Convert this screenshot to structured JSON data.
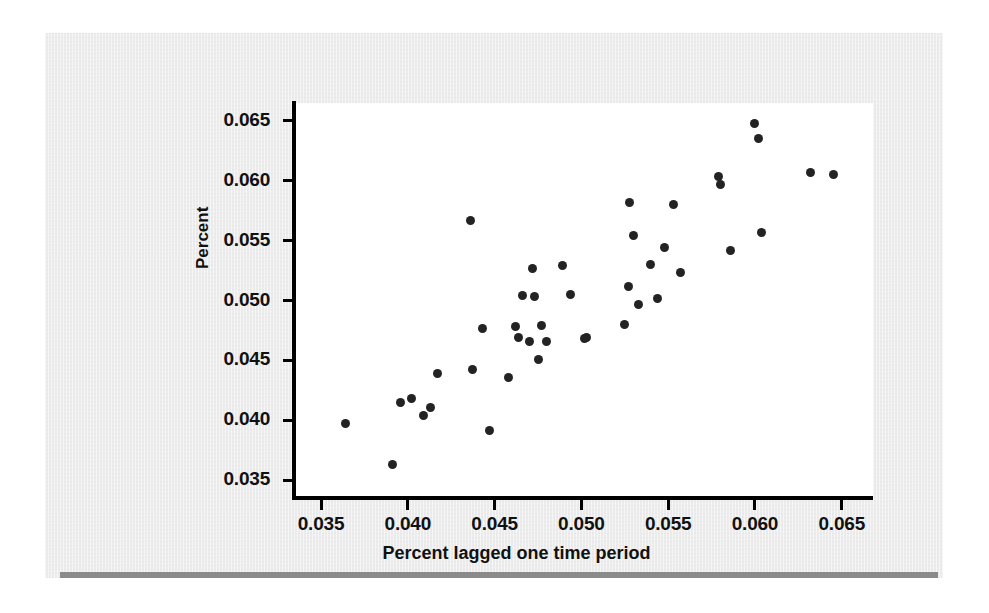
{
  "figure": {
    "background_color": "#ececec",
    "page_background": "#ffffff",
    "rule_color": "#8b8b8b",
    "plot_background": "#ffffff",
    "axis_color": "#000000",
    "point_color": "#232323"
  },
  "chart_data": {
    "type": "scatter",
    "title": "",
    "subtitle": "",
    "xlabel": "Percent lagged one time period",
    "ylabel": "Percent",
    "xlim": [
      0.0335,
      0.0668
    ],
    "ylim": [
      0.0335,
      0.0665
    ],
    "xticks": [
      0.035,
      0.04,
      0.045,
      0.05,
      0.055,
      0.06,
      0.065
    ],
    "yticks": [
      0.035,
      0.04,
      0.045,
      0.05,
      0.055,
      0.06,
      0.065
    ],
    "xtick_labels": [
      "0.035",
      "0.040",
      "0.045",
      "0.050",
      "0.055",
      "0.060",
      "0.065"
    ],
    "ytick_labels": [
      "0.035",
      "0.040",
      "0.045",
      "0.050",
      "0.055",
      "0.060",
      "0.065"
    ],
    "grid": false,
    "legend": null,
    "annotations": [],
    "marker": "circle",
    "marker_size": 9,
    "n_points": 42,
    "points": [
      {
        "x": 0.0364,
        "y": 0.0397
      },
      {
        "x": 0.0391,
        "y": 0.0363
      },
      {
        "x": 0.0396,
        "y": 0.0415
      },
      {
        "x": 0.0402,
        "y": 0.0418
      },
      {
        "x": 0.0409,
        "y": 0.0404
      },
      {
        "x": 0.0413,
        "y": 0.0411
      },
      {
        "x": 0.0417,
        "y": 0.0439
      },
      {
        "x": 0.0436,
        "y": 0.0567
      },
      {
        "x": 0.0437,
        "y": 0.0442
      },
      {
        "x": 0.0443,
        "y": 0.0477
      },
      {
        "x": 0.0447,
        "y": 0.0391
      },
      {
        "x": 0.0458,
        "y": 0.0436
      },
      {
        "x": 0.0462,
        "y": 0.0478
      },
      {
        "x": 0.0464,
        "y": 0.0469
      },
      {
        "x": 0.0466,
        "y": 0.0504
      },
      {
        "x": 0.047,
        "y": 0.0466
      },
      {
        "x": 0.0472,
        "y": 0.0527
      },
      {
        "x": 0.0473,
        "y": 0.0503
      },
      {
        "x": 0.0475,
        "y": 0.0451
      },
      {
        "x": 0.0477,
        "y": 0.0479
      },
      {
        "x": 0.048,
        "y": 0.0466
      },
      {
        "x": 0.0489,
        "y": 0.0529
      },
      {
        "x": 0.0494,
        "y": 0.0505
      },
      {
        "x": 0.0502,
        "y": 0.0468
      },
      {
        "x": 0.0503,
        "y": 0.0469
      },
      {
        "x": 0.0525,
        "y": 0.048
      },
      {
        "x": 0.0527,
        "y": 0.0512
      },
      {
        "x": 0.0528,
        "y": 0.0582
      },
      {
        "x": 0.053,
        "y": 0.0554
      },
      {
        "x": 0.0533,
        "y": 0.0497
      },
      {
        "x": 0.054,
        "y": 0.053
      },
      {
        "x": 0.0544,
        "y": 0.0502
      },
      {
        "x": 0.0548,
        "y": 0.0544
      },
      {
        "x": 0.0553,
        "y": 0.058
      },
      {
        "x": 0.0557,
        "y": 0.0523
      },
      {
        "x": 0.0579,
        "y": 0.0604
      },
      {
        "x": 0.058,
        "y": 0.0597
      },
      {
        "x": 0.0586,
        "y": 0.0542
      },
      {
        "x": 0.06,
        "y": 0.0648
      },
      {
        "x": 0.0602,
        "y": 0.0635
      },
      {
        "x": 0.0604,
        "y": 0.0557
      },
      {
        "x": 0.0632,
        "y": 0.0607
      },
      {
        "x": 0.0645,
        "y": 0.0605
      }
    ]
  }
}
